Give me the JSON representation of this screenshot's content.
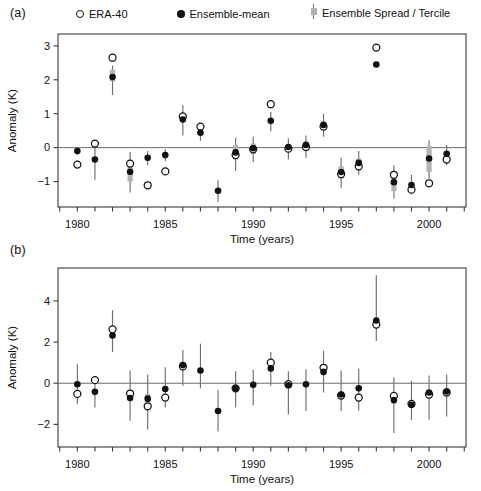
{
  "figure": {
    "width": 481,
    "height": 491,
    "background": "#ffffff"
  },
  "legend": {
    "position": "top",
    "items": [
      {
        "key": "era40",
        "label": "ERA-40",
        "marker": "open-circle",
        "color": "#111111"
      },
      {
        "key": "ensemble_mean",
        "label": "Ensemble-mean",
        "marker": "filled-circle",
        "color": "#111111"
      },
      {
        "key": "spread",
        "label": "Ensemble Spread / Tercile",
        "marker": "bar-with-box",
        "color": "#6f6f6f",
        "box_color": "#b4b4b4"
      }
    ]
  },
  "panels": [
    {
      "tag": "(a)",
      "xlabel": "Time (years)",
      "ylabel": "Anomaly (K)"
    },
    {
      "tag": "(b)",
      "xlabel": "Time (years)",
      "ylabel": "Anomaly (K)"
    }
  ],
  "chart_data": [
    {
      "type": "scatter",
      "panel": "(a)",
      "title": "",
      "xlabel": "Time (years)",
      "ylabel": "Anomaly (K)",
      "xlim": [
        1978.9,
        2002.1
      ],
      "ylim": [
        -1.75,
        3.35
      ],
      "xticks": [
        1979,
        1980,
        1981,
        1982,
        1983,
        1984,
        1985,
        1986,
        1987,
        1988,
        1989,
        1990,
        1991,
        1992,
        1993,
        1994,
        1995,
        1996,
        1997,
        1998,
        1999,
        2000,
        2001,
        2002
      ],
      "xticklabels": [
        {
          "x": 1980,
          "text": "1980"
        },
        {
          "x": 1985,
          "text": "1985"
        },
        {
          "x": 1990,
          "text": "1990"
        },
        {
          "x": 1995,
          "text": "1995"
        },
        {
          "x": 2000,
          "text": "2000"
        }
      ],
      "yticks": [
        3,
        2,
        1,
        0,
        -1
      ],
      "yticklabels": [
        "3",
        "2",
        "1",
        "0",
        "−1"
      ],
      "grid": false,
      "zero_line": 0,
      "legend_position": "above-axes",
      "x": [
        1980,
        1981,
        1982,
        1983,
        1984,
        1985,
        1986,
        1987,
        1988,
        1989,
        1990,
        1991,
        1992,
        1993,
        1994,
        1995,
        1996,
        1997,
        1998,
        1999,
        2000,
        2001
      ],
      "series": [
        {
          "name": "ERA-40",
          "marker": "open-circle",
          "values": [
            -0.5,
            0.12,
            2.65,
            -0.47,
            -1.11,
            -0.7,
            0.92,
            0.62,
            null,
            -0.22,
            -0.05,
            1.28,
            -0.03,
            0.02,
            0.62,
            -0.78,
            -0.55,
            2.95,
            -0.8,
            -1.24,
            -1.05,
            -0.35
          ]
        },
        {
          "name": "Ensemble-mean",
          "marker": "filled-circle",
          "values": [
            -0.1,
            -0.35,
            2.08,
            -0.71,
            -0.3,
            -0.22,
            0.83,
            0.44,
            -1.27,
            -0.14,
            -0.02,
            0.79,
            0.02,
            0.08,
            0.67,
            -0.72,
            -0.45,
            2.45,
            -1.02,
            -1.1,
            -0.32,
            -0.18
          ]
        },
        {
          "name": "Ensemble Spread",
          "marker": "vertical-line",
          "low": [
            -0.22,
            -0.95,
            1.55,
            -1.32,
            -0.52,
            -0.4,
            0.36,
            0.2,
            -1.6,
            -0.68,
            -0.42,
            0.48,
            -0.35,
            -0.3,
            0.32,
            -1.18,
            -0.8,
            null,
            -1.5,
            -1.38,
            -0.92,
            -0.52
          ],
          "high": [
            0.02,
            0.1,
            2.42,
            -0.12,
            -0.1,
            -0.05,
            1.25,
            0.68,
            -0.95,
            0.3,
            0.32,
            1.05,
            0.28,
            0.36,
            1.0,
            -0.3,
            -0.1,
            null,
            -0.52,
            -0.8,
            0.22,
            0.08
          ]
        },
        {
          "name": "Tercile",
          "marker": "grey-box",
          "low": [
            null,
            null,
            1.95,
            -1.0,
            null,
            null,
            null,
            null,
            null,
            -0.35,
            -0.18,
            null,
            null,
            null,
            null,
            -0.92,
            -0.58,
            null,
            -1.28,
            null,
            -0.72,
            null
          ],
          "high": [
            null,
            null,
            2.3,
            -0.55,
            null,
            null,
            null,
            null,
            null,
            0.08,
            0.12,
            null,
            null,
            null,
            null,
            -0.55,
            -0.32,
            null,
            -0.88,
            null,
            0.05,
            null
          ]
        }
      ]
    },
    {
      "type": "scatter",
      "panel": "(b)",
      "title": "",
      "xlabel": "Time (years)",
      "ylabel": "Anomaly (K)",
      "xlim": [
        1978.9,
        2002.1
      ],
      "ylim": [
        -3.1,
        5.6
      ],
      "xticks": [
        1979,
        1980,
        1981,
        1982,
        1983,
        1984,
        1985,
        1986,
        1987,
        1988,
        1989,
        1990,
        1991,
        1992,
        1993,
        1994,
        1995,
        1996,
        1997,
        1998,
        1999,
        2000,
        2001,
        2002
      ],
      "xticklabels": [
        {
          "x": 1980,
          "text": "1980"
        },
        {
          "x": 1985,
          "text": "1985"
        },
        {
          "x": 1990,
          "text": "1990"
        },
        {
          "x": 1995,
          "text": "1995"
        },
        {
          "x": 2000,
          "text": "2000"
        }
      ],
      "yticks": [
        4,
        2,
        0,
        -2
      ],
      "yticklabels": [
        "4",
        "2",
        "0",
        "−2"
      ],
      "grid": false,
      "zero_line": 0,
      "legend_position": "none",
      "x": [
        1980,
        1981,
        1982,
        1983,
        1984,
        1985,
        1986,
        1987,
        1988,
        1989,
        1990,
        1991,
        1992,
        1993,
        1994,
        1995,
        1996,
        1997,
        1998,
        1999,
        2000,
        2001
      ],
      "series": [
        {
          "name": "ERA-40",
          "marker": "open-circle",
          "values": [
            -0.52,
            0.15,
            2.62,
            -0.5,
            -1.12,
            -0.7,
            0.82,
            null,
            null,
            -0.25,
            null,
            1.0,
            -0.05,
            null,
            0.75,
            -0.6,
            -0.7,
            2.85,
            -0.62,
            -1.0,
            -0.55,
            -0.45
          ]
        },
        {
          "name": "Ensemble-mean",
          "marker": "filled-circle",
          "values": [
            -0.05,
            -0.42,
            2.32,
            -0.72,
            -0.75,
            -0.28,
            0.88,
            0.62,
            -1.35,
            -0.25,
            -0.08,
            0.72,
            -0.1,
            -0.05,
            0.55,
            -0.55,
            -0.25,
            3.05,
            -0.82,
            -1.05,
            -0.45,
            -0.4
          ]
        },
        {
          "name": "Ensemble Spread",
          "marker": "vertical-line",
          "low": [
            -1.02,
            -1.18,
            1.52,
            -1.82,
            -2.25,
            -1.18,
            -0.12,
            -0.25,
            -2.35,
            -1.18,
            -1.08,
            -0.12,
            -1.52,
            -1.35,
            -0.45,
            -1.35,
            -1.32,
            2.05,
            -2.42,
            -1.78,
            -1.78,
            -1.62
          ],
          "high": [
            0.92,
            0.35,
            3.55,
            0.62,
            0.42,
            0.78,
            1.62,
            1.92,
            -0.32,
            0.58,
            0.65,
            1.52,
            0.58,
            0.68,
            1.58,
            0.62,
            0.72,
            5.25,
            0.28,
            0.12,
            0.38,
            0.42
          ]
        },
        {
          "name": "Tercile",
          "marker": "grey-box",
          "low": [
            null,
            null,
            null,
            null,
            -0.95,
            null,
            null,
            null,
            null,
            null,
            null,
            null,
            null,
            null,
            null,
            null,
            null,
            2.72,
            -1.0,
            null,
            null,
            null
          ],
          "high": [
            null,
            null,
            null,
            null,
            -0.52,
            null,
            null,
            null,
            null,
            null,
            null,
            null,
            null,
            null,
            null,
            null,
            null,
            3.0,
            -0.72,
            null,
            null,
            null
          ]
        }
      ]
    }
  ]
}
